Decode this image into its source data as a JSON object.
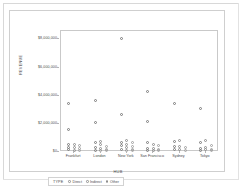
{
  "chart_data": {
    "type": "scatter",
    "title": "",
    "xlabel": "HUB",
    "ylabel": "REVENUE",
    "categories": [
      "Frankfurt",
      "London",
      "New York",
      "San Francisco",
      "Sydney",
      "Tokyo"
    ],
    "ytick_labels": [
      "$8,000,000",
      "$6,000,000",
      "$4,000,000",
      "$2,000,000",
      "$0"
    ],
    "ytick_values": [
      8000000,
      6000000,
      4000000,
      2000000,
      0
    ],
    "ylim": [
      0,
      8600000
    ],
    "grid": false,
    "legend": {
      "title": "TYPE",
      "position": "bottom",
      "entries": [
        "Direct",
        "Indirect",
        "Other"
      ]
    },
    "series": [
      {
        "name": "Direct",
        "points": [
          {
            "hub": "Frankfurt",
            "revenue": 3450000
          },
          {
            "hub": "Frankfurt",
            "revenue": 1620000
          },
          {
            "hub": "Frankfurt",
            "revenue": 560000
          },
          {
            "hub": "Frankfurt",
            "revenue": 330000
          },
          {
            "hub": "Frankfurt",
            "revenue": 150000
          },
          {
            "hub": "London",
            "revenue": 3660000
          },
          {
            "hub": "London",
            "revenue": 2110000
          },
          {
            "hub": "London",
            "revenue": 640000
          },
          {
            "hub": "London",
            "revenue": 300000
          },
          {
            "hub": "London",
            "revenue": 120000
          },
          {
            "hub": "New York",
            "revenue": 8100000
          },
          {
            "hub": "New York",
            "revenue": 2670000
          },
          {
            "hub": "New York",
            "revenue": 700000
          },
          {
            "hub": "New York",
            "revenue": 430000
          },
          {
            "hub": "New York",
            "revenue": 170000
          },
          {
            "hub": "San Francisco",
            "revenue": 4270000
          },
          {
            "hub": "San Francisco",
            "revenue": 2190000
          },
          {
            "hub": "San Francisco",
            "revenue": 640000
          },
          {
            "hub": "San Francisco",
            "revenue": 230000
          },
          {
            "hub": "San Francisco",
            "revenue": 120000
          },
          {
            "hub": "Sydney",
            "revenue": 3470000
          },
          {
            "hub": "Sydney",
            "revenue": 730000
          },
          {
            "hub": "Sydney",
            "revenue": 380000
          },
          {
            "hub": "Sydney",
            "revenue": 200000
          },
          {
            "hub": "Tokyo",
            "revenue": 3100000
          },
          {
            "hub": "Tokyo",
            "revenue": 680000
          },
          {
            "hub": "Tokyo",
            "revenue": 260000
          },
          {
            "hub": "Tokyo",
            "revenue": 130000
          }
        ]
      },
      {
        "name": "Indirect",
        "points": [
          {
            "hub": "Frankfurt",
            "revenue": 520000
          },
          {
            "hub": "Frankfurt",
            "revenue": 300000
          },
          {
            "hub": "Frankfurt",
            "revenue": 140000
          },
          {
            "hub": "London",
            "revenue": 760000
          },
          {
            "hub": "London",
            "revenue": 500000
          },
          {
            "hub": "London",
            "revenue": 250000
          },
          {
            "hub": "London",
            "revenue": 110000
          },
          {
            "hub": "New York",
            "revenue": 800000
          },
          {
            "hub": "New York",
            "revenue": 520000
          },
          {
            "hub": "New York",
            "revenue": 300000
          },
          {
            "hub": "New York",
            "revenue": 140000
          },
          {
            "hub": "San Francisco",
            "revenue": 560000
          },
          {
            "hub": "San Francisco",
            "revenue": 280000
          },
          {
            "hub": "San Francisco",
            "revenue": 130000
          },
          {
            "hub": "Sydney",
            "revenue": 810000
          },
          {
            "hub": "Sydney",
            "revenue": 420000
          },
          {
            "hub": "Sydney",
            "revenue": 160000
          },
          {
            "hub": "Tokyo",
            "revenue": 790000
          },
          {
            "hub": "Tokyo",
            "revenue": 340000
          },
          {
            "hub": "Tokyo",
            "revenue": 150000
          }
        ]
      },
      {
        "name": "Other",
        "points": [
          {
            "hub": "Frankfurt",
            "revenue": 470000
          },
          {
            "hub": "Frankfurt",
            "revenue": 240000
          },
          {
            "hub": "Frankfurt",
            "revenue": 110000
          },
          {
            "hub": "London",
            "revenue": 420000
          },
          {
            "hub": "London",
            "revenue": 190000
          },
          {
            "hub": "London",
            "revenue": 100000
          },
          {
            "hub": "New York",
            "revenue": 660000
          },
          {
            "hub": "New York",
            "revenue": 360000
          },
          {
            "hub": "New York",
            "revenue": 180000
          },
          {
            "hub": "New York",
            "revenue": 100000
          },
          {
            "hub": "San Francisco",
            "revenue": 430000
          },
          {
            "hub": "San Francisco",
            "revenue": 200000
          },
          {
            "hub": "San Francisco",
            "revenue": 100000
          },
          {
            "hub": "Sydney",
            "revenue": 300000
          },
          {
            "hub": "Sydney",
            "revenue": 140000
          },
          {
            "hub": "Tokyo",
            "revenue": 430000
          },
          {
            "hub": "Tokyo",
            "revenue": 190000
          },
          {
            "hub": "Tokyo",
            "revenue": 100000
          }
        ]
      }
    ]
  }
}
